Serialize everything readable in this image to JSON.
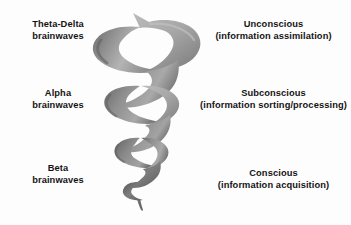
{
  "figure": {
    "title_visible": false,
    "background_color": "#fdfdfd",
    "left_labels": [
      {
        "name": "theta-delta",
        "line1": "Theta-Delta",
        "line2": "brainwaves"
      },
      {
        "name": "alpha",
        "line1": "Alpha",
        "line2": "brainwaves"
      },
      {
        "name": "beta",
        "line1": "Beta",
        "line2": "brainwaves"
      }
    ],
    "right_labels": [
      {
        "name": "unconscious",
        "line1": "Unconscious",
        "line2": "(information assimilation)"
      },
      {
        "name": "subconscious",
        "line1": "Subconscious",
        "line2": "(information sorting/processing)"
      },
      {
        "name": "conscious",
        "line1": "Conscious",
        "line2": "(information acquisition)"
      }
    ],
    "graphic": {
      "name": "helix-spiral",
      "description": "grayscale three-dimensional spiral ribbon, widest coil at top tapering to a thin tail at the bottom",
      "colors": {
        "highlight": "#c6c6c6",
        "midtone": "#9a9a9a",
        "shadow": "#6b6b6b",
        "deep_shadow": "#565656"
      }
    }
  }
}
